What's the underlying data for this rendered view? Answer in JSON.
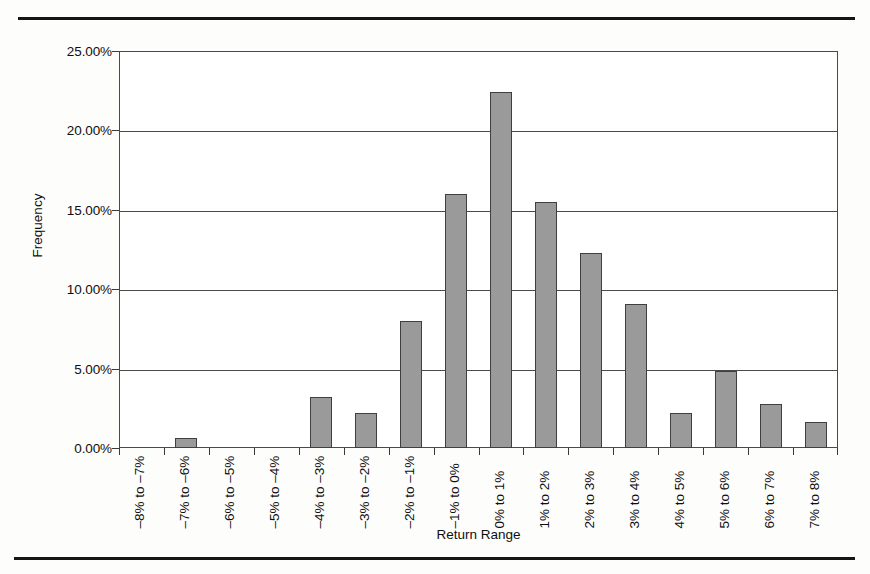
{
  "figure": {
    "top_rule": "horizontal-rule",
    "bottom_rule": "horizontal-rule"
  },
  "chart_data": {
    "type": "bar",
    "title": "",
    "xlabel": "Return Range",
    "ylabel": "Frequency",
    "categories": [
      "–8% to –7%",
      "–7% to –6%",
      "–6% to –5%",
      "–5% to –4%",
      "–4% to –3%",
      "–3% to –2%",
      "–2% to –1%",
      "–1% to 0%",
      "0% to 1%",
      "1% to 2%",
      "2% to 3%",
      "3% to 4%",
      "4% to 5%",
      "5% to 6%",
      "6% to 7%",
      "7% to 8%"
    ],
    "values": [
      0.0,
      0.6,
      0.0,
      0.0,
      3.2,
      2.2,
      8.0,
      16.0,
      22.4,
      15.5,
      12.3,
      9.1,
      2.2,
      4.85,
      2.75,
      1.65
    ],
    "ylim": [
      0,
      25
    ],
    "yticks": [
      0,
      5,
      10,
      15,
      20,
      25
    ],
    "ytick_labels": [
      "0.00%",
      "5.00%",
      "10.00%",
      "15.00%",
      "20.00%",
      "25.00%"
    ],
    "grid": true,
    "legend": null,
    "bar_color": "#9a9a9a",
    "bar_border_color": "#3f3f3f",
    "axis_color": "#4a4a4a"
  }
}
